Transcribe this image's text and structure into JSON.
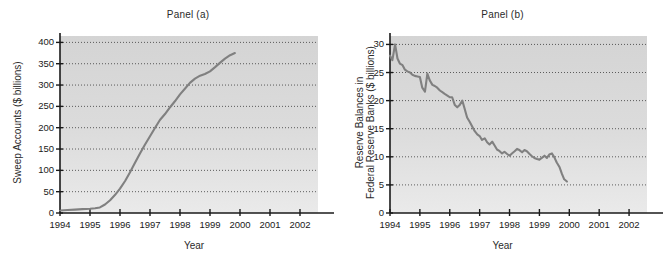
{
  "figure": {
    "background_color": "#ffffff",
    "plot_background_color": "#d9d9d9",
    "line_color": "#808080",
    "axis_color": "#1a1a1a",
    "gridline_color": "#333333"
  },
  "panels": [
    {
      "id": "panel-a",
      "title": "Panel (a)",
      "xlabel": "Year",
      "ylabel": "Sweep Accounts ($ billions)"
    },
    {
      "id": "panel-b",
      "title": "Panel (b)",
      "xlabel": "Year",
      "ylabel_line1": "Reserve Balances in",
      "ylabel_line2": "Federal Reserve Banks ($ billions)"
    }
  ],
  "chart_data": [
    {
      "type": "line",
      "title": "Panel (a)",
      "xlabel": "Year",
      "ylabel": "Sweep Accounts ($ billions)",
      "xlim": [
        1994,
        2002.6
      ],
      "ylim": [
        0,
        415
      ],
      "xticks": [
        1994,
        1995,
        1996,
        1997,
        1998,
        1999,
        2000,
        2001,
        2002
      ],
      "xtick_labels": [
        "1994",
        "1995",
        "1996",
        "1997",
        "1998",
        "1999",
        "2000",
        "2001",
        "2002"
      ],
      "yticks": [
        0,
        50,
        100,
        150,
        200,
        250,
        300,
        350,
        400
      ],
      "ytick_labels": [
        "0",
        "50",
        "100",
        "150",
        "200",
        "250",
        "300",
        "350",
        "400"
      ],
      "grid": "horizontal-dotted",
      "legend": "none",
      "series": [
        {
          "name": "Sweep Accounts",
          "x": [
            1994.0,
            1994.25,
            1994.5,
            1994.75,
            1995.0,
            1995.17,
            1995.33,
            1995.5,
            1995.67,
            1995.83,
            1996.0,
            1996.17,
            1996.33,
            1996.5,
            1996.67,
            1996.83,
            1997.0,
            1997.17,
            1997.33,
            1997.5,
            1997.67,
            1997.83,
            1998.0,
            1998.17,
            1998.33,
            1998.5,
            1998.67,
            1998.83,
            1999.0,
            1999.17,
            1999.33,
            1999.5,
            1999.67,
            1999.83
          ],
          "y": [
            6,
            7,
            8,
            9,
            10,
            11,
            13,
            20,
            30,
            42,
            57,
            75,
            95,
            118,
            140,
            160,
            180,
            200,
            218,
            232,
            248,
            262,
            278,
            292,
            305,
            315,
            322,
            326,
            332,
            342,
            352,
            362,
            370,
            375
          ]
        }
      ]
    },
    {
      "type": "line",
      "title": "Panel (b)",
      "xlabel": "Year",
      "ylabel": "Reserve Balances in Federal Reserve Banks ($ billions)",
      "xlim": [
        1994,
        2002.6
      ],
      "ylim": [
        0,
        31.5
      ],
      "xticks": [
        1994,
        1995,
        1996,
        1997,
        1998,
        1999,
        2000,
        2001,
        2002
      ],
      "xtick_labels": [
        "1994",
        "1995",
        "1996",
        "1997",
        "1998",
        "1999",
        "2000",
        "2001",
        "2002"
      ],
      "yticks": [
        0,
        5,
        10,
        15,
        20,
        25,
        30
      ],
      "ytick_labels": [
        "0",
        "5",
        "10",
        "15",
        "20",
        "25",
        "30"
      ],
      "grid": "horizontal-dotted",
      "legend": "none",
      "series": [
        {
          "name": "Reserve Balances",
          "x": [
            1994.0,
            1994.08,
            1994.17,
            1994.25,
            1994.33,
            1994.42,
            1994.5,
            1994.58,
            1994.67,
            1994.75,
            1994.83,
            1994.92,
            1995.0,
            1995.08,
            1995.17,
            1995.25,
            1995.33,
            1995.42,
            1995.5,
            1995.58,
            1995.67,
            1995.75,
            1995.83,
            1995.92,
            1996.0,
            1996.08,
            1996.17,
            1996.25,
            1996.33,
            1996.42,
            1996.5,
            1996.58,
            1996.67,
            1996.75,
            1996.83,
            1996.92,
            1997.0,
            1997.08,
            1997.17,
            1997.25,
            1997.33,
            1997.42,
            1997.5,
            1997.58,
            1997.67,
            1997.75,
            1997.83,
            1997.92,
            1998.0,
            1998.08,
            1998.17,
            1998.25,
            1998.33,
            1998.42,
            1998.5,
            1998.58,
            1998.67,
            1998.75,
            1998.83,
            1998.92,
            1999.0,
            1999.08,
            1999.17,
            1999.25,
            1999.33,
            1999.42,
            1999.5,
            1999.58,
            1999.67,
            1999.75,
            1999.83,
            1999.92
          ],
          "y": [
            28.0,
            27.2,
            30.0,
            27.5,
            26.6,
            26.3,
            25.5,
            25.2,
            25.0,
            24.6,
            24.4,
            24.3,
            24.2,
            22.3,
            21.6,
            24.8,
            23.6,
            22.8,
            22.6,
            22.3,
            21.8,
            21.5,
            21.2,
            20.9,
            20.6,
            20.6,
            19.2,
            18.8,
            19.2,
            20.0,
            18.5,
            17.0,
            16.2,
            15.4,
            14.6,
            14.0,
            13.7,
            13.0,
            13.3,
            12.6,
            12.2,
            12.7,
            12.0,
            11.3,
            11.0,
            10.6,
            10.9,
            10.5,
            10.2,
            10.6,
            11.0,
            11.4,
            11.2,
            10.8,
            11.2,
            11.0,
            10.5,
            10.1,
            9.8,
            9.6,
            9.5,
            9.8,
            10.2,
            9.8,
            10.4,
            10.6,
            9.9,
            9.0,
            8.2,
            7.0,
            6.0,
            5.6
          ]
        }
      ]
    }
  ]
}
